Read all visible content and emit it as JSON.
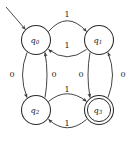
{
  "diagram": {
    "type": "finite-state-automaton",
    "alphabet": [
      "0",
      "1"
    ],
    "start_state": "q0",
    "accepting_states": [
      "q3"
    ],
    "states": [
      {
        "id": "q0",
        "name": "q",
        "subscript": "0",
        "cx": 36,
        "cy": 40,
        "r": 14.5,
        "accepting": false,
        "start": true
      },
      {
        "id": "q1",
        "name": "q",
        "subscript": "1",
        "cx": 99,
        "cy": 40,
        "r": 14.5,
        "accepting": false,
        "start": false
      },
      {
        "id": "q2",
        "name": "q",
        "subscript": "2",
        "cx": 36,
        "cy": 110,
        "r": 14.5,
        "accepting": false,
        "start": false
      },
      {
        "id": "q3",
        "name": "q",
        "subscript": "3",
        "cx": 99,
        "cy": 110,
        "r": 14.5,
        "accepting": true,
        "start": false
      }
    ],
    "transitions": [
      {
        "from": "q0",
        "to": "q1",
        "symbol": "1",
        "label_x": 67,
        "label_y": 15
      },
      {
        "from": "q1",
        "to": "q0",
        "symbol": "1",
        "label_x": 67,
        "label_y": 46
      },
      {
        "from": "q0",
        "to": "q2",
        "symbol": "0",
        "label_x": 12,
        "label_y": 75
      },
      {
        "from": "q2",
        "to": "q0",
        "symbol": "0",
        "label_x": 54,
        "label_y": 75
      },
      {
        "from": "q1",
        "to": "q3",
        "symbol": "0",
        "label_x": 81,
        "label_y": 75
      },
      {
        "from": "q3",
        "to": "q1",
        "symbol": "0",
        "label_x": 123,
        "label_y": 75
      },
      {
        "from": "q2",
        "to": "q3",
        "symbol": "1",
        "label_x": 67,
        "label_y": 90
      },
      {
        "from": "q3",
        "to": "q2",
        "symbol": "1",
        "label_x": 67,
        "label_y": 124
      }
    ],
    "colors": {
      "background": "#ffffff",
      "state_stroke": "#2b2b2b",
      "edge_stroke": "#3a3a3a",
      "text": "#1c1c1c"
    }
  }
}
